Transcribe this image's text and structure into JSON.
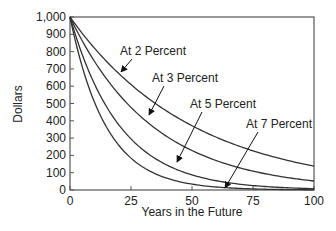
{
  "chart_data": {
    "type": "line",
    "title": "",
    "xlabel": "Years in the Future",
    "ylabel": "Dollars",
    "xlim": [
      0,
      100
    ],
    "ylim": [
      0,
      1000
    ],
    "xticks": [
      0,
      25,
      50,
      75,
      100
    ],
    "xtick_labels": [
      "0",
      "25",
      "50",
      "75",
      "100"
    ],
    "yticks": [
      0,
      100,
      200,
      300,
      400,
      500,
      600,
      700,
      800,
      900,
      1000
    ],
    "ytick_labels": [
      "0",
      "100",
      "200",
      "300",
      "400",
      "500",
      "600",
      "700",
      "800",
      "900",
      "1,000"
    ],
    "grid": false,
    "legend": "none (inline annotations with arrows)",
    "x": [
      0,
      10,
      20,
      25,
      30,
      40,
      50,
      60,
      70,
      75,
      80,
      90,
      100
    ],
    "series": [
      {
        "name": "At 2 Percent",
        "rate": 0.02,
        "values": [
          1000,
          820,
          673,
          610,
          552,
          453,
          372,
          305,
          250,
          227,
          205,
          168,
          138
        ]
      },
      {
        "name": "At 3 Percent",
        "rate": 0.03,
        "values": [
          1000,
          744,
          554,
          478,
          412,
          307,
          228,
          170,
          126,
          109,
          94,
          70,
          52
        ]
      },
      {
        "name": "At 5 Percent",
        "rate": 0.05,
        "values": [
          1000,
          614,
          377,
          295,
          231,
          142,
          87,
          54,
          33,
          26,
          20,
          12,
          8
        ]
      },
      {
        "name": "At 7 Percent",
        "rate": 0.07,
        "values": [
          1000,
          508,
          258,
          184,
          131,
          67,
          34,
          17,
          9,
          6,
          5,
          2,
          1
        ]
      }
    ],
    "annotations": [
      {
        "text": "At 2 Percent",
        "label_x": 120,
        "label_y": 55,
        "arrow_to": [
          121,
          72
        ]
      },
      {
        "text": "At 3 Percent",
        "label_x": 152,
        "label_y": 82,
        "arrow_to": [
          149,
          115
        ]
      },
      {
        "text": "At 5 Percent",
        "label_x": 190,
        "label_y": 108,
        "arrow_to": [
          177,
          162
        ]
      },
      {
        "text": "At 7 Percent",
        "label_x": 246,
        "label_y": 128,
        "arrow_to": [
          225,
          188
        ]
      }
    ]
  }
}
